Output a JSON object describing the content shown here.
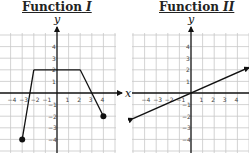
{
  "chart_data": [
    {
      "type": "line",
      "title": "Function",
      "title_numeral": "I",
      "xlabel": "x",
      "ylabel": "y",
      "xlim": [
        -5,
        5
      ],
      "ylim": [
        -5,
        5
      ],
      "x_ticks": [
        -4,
        -3,
        -2,
        -1,
        1,
        2,
        3,
        4
      ],
      "y_ticks": [
        -4,
        -3,
        -2,
        -1,
        1,
        2,
        3,
        4
      ],
      "x_tick_labels": [
        "−4",
        "−3",
        "−2",
        "−1",
        "1",
        "2",
        "3",
        "4"
      ],
      "y_tick_labels": [
        "−4",
        "−3",
        "−2",
        "−1",
        "1",
        "2",
        "3",
        "4"
      ],
      "grid": true,
      "series": [
        {
          "name": "Function I",
          "points": [
            [
              -3,
              -4
            ],
            [
              -2,
              2
            ],
            [
              2,
              2
            ],
            [
              4,
              -2
            ]
          ],
          "closed_endpoints": [
            [
              -3,
              -4
            ],
            [
              4,
              -2
            ]
          ],
          "arrows": false
        }
      ]
    },
    {
      "type": "line",
      "title": "Function",
      "title_numeral": "II",
      "xlabel": "x",
      "ylabel": "y",
      "xlim": [
        -5,
        5
      ],
      "ylim": [
        -5,
        5
      ],
      "x_ticks": [
        -4,
        -3,
        -2,
        -1,
        1,
        2,
        3,
        4
      ],
      "y_ticks": [
        -4,
        -3,
        -2,
        -1,
        1,
        2,
        3,
        4
      ],
      "x_tick_labels": [
        "−4",
        "−3",
        "−2",
        "−1",
        "1",
        "2",
        "3",
        "4"
      ],
      "y_tick_labels": [
        "−4",
        "−3",
        "−2",
        "−1",
        "1",
        "2",
        "3",
        "4"
      ],
      "grid": true,
      "series": [
        {
          "name": "Function II",
          "points": [
            [
              -5,
              -2.2
            ],
            [
              5,
              2.2
            ]
          ],
          "slope": 0.44,
          "arrows": true
        }
      ]
    }
  ]
}
